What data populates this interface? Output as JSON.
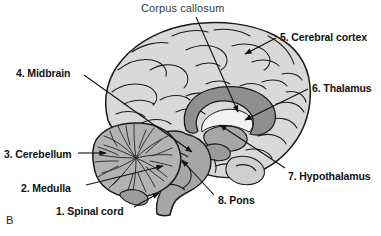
{
  "figure": {
    "panel_letter": "B",
    "background_color": "#ffffff",
    "width": 381,
    "height": 236
  },
  "palette": {
    "cortex_fill": "#d9d9d9",
    "cortex_fill_light": "#e4e4e4",
    "outline": "#1a1a1a",
    "brainstem_fill": "#a6a6a6",
    "corpus_callosum_fill": "#8f8f8f",
    "cerebellum_fill": "#b2b2b2",
    "ventricle_fill": "#f2f2f2",
    "leader_line": "#111111",
    "text": "#111111",
    "text_plain": "#3a3a3a"
  },
  "labels": [
    {
      "id": "corpus-callosum",
      "text": "Corpus callosum",
      "style": "plain",
      "x": 141,
      "y": 2,
      "leader": {
        "x1": 196,
        "y1": 17,
        "x2": 238,
        "y2": 112,
        "arrow": true
      }
    },
    {
      "id": "cerebral-cortex",
      "text": "5. Cerebral cortex",
      "style": "bold",
      "x": 280,
      "y": 31,
      "leader": {
        "x1": 276,
        "y1": 38,
        "x2": 245,
        "y2": 54,
        "arrow": true
      }
    },
    {
      "id": "midbrain",
      "text": "4. Midbrain",
      "style": "bold",
      "x": 16,
      "y": 67,
      "leader": {
        "x1": 84,
        "y1": 75,
        "x2": 192,
        "y2": 152,
        "arrow": true
      }
    },
    {
      "id": "thalamus",
      "text": "6. Thalamus",
      "style": "bold",
      "x": 312,
      "y": 82,
      "leader": {
        "x1": 308,
        "y1": 89,
        "x2": 245,
        "y2": 120,
        "arrow": true
      }
    },
    {
      "id": "cerebellum",
      "text": "3. Cerebellum",
      "style": "bold",
      "x": 4,
      "y": 148,
      "leader": {
        "x1": 78,
        "y1": 153,
        "x2": 106,
        "y2": 153,
        "arrow": true
      }
    },
    {
      "id": "hypothalamus",
      "text": "7. Hypothalamus",
      "style": "bold",
      "x": 288,
      "y": 170,
      "leader": {
        "x1": 285,
        "y1": 168,
        "x2": 220,
        "y2": 125,
        "arrow": true
      }
    },
    {
      "id": "medulla",
      "text": "2. Medulla",
      "style": "bold",
      "x": 21,
      "y": 182,
      "leader": {
        "x1": 86,
        "y1": 185,
        "x2": 163,
        "y2": 166,
        "arrow": true
      }
    },
    {
      "id": "pons",
      "text": "8. Pons",
      "style": "bold",
      "x": 218,
      "y": 194,
      "leader": {
        "x1": 214,
        "y1": 195,
        "x2": 182,
        "y2": 160,
        "arrow": true
      }
    },
    {
      "id": "spinal-cord",
      "text": "1. Spinal cord",
      "style": "bold",
      "x": 56,
      "y": 205,
      "leader": {
        "x1": 134,
        "y1": 207,
        "x2": 159,
        "y2": 193,
        "arrow": true
      }
    }
  ]
}
